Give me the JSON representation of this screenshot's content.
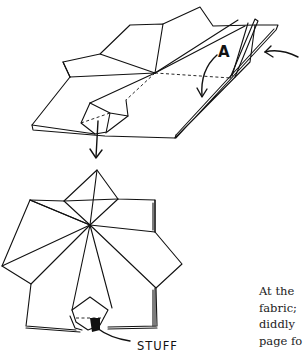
{
  "figure": {
    "step_top": {
      "fold_label": "A"
    },
    "step_bottom": {
      "action_label": "STUFF"
    }
  },
  "text": {
    "lines": [
      "At the",
      "fabric;",
      "diddly",
      "page fo"
    ]
  },
  "colors": {
    "ink": "#111111",
    "background": "#ffffff",
    "text": "#222222"
  }
}
